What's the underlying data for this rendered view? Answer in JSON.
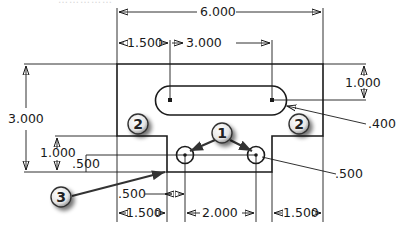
{
  "drawing": {
    "title_faint": "……………",
    "overall": {
      "width_label": "6.000",
      "height_label": "3.000"
    },
    "slot": {
      "offset_label": "1.500",
      "length_label": "3.000",
      "height_label": "1.000",
      "radius_label": ".400"
    },
    "notch": {
      "depth_label": "1.000",
      "left_width_label": "1.500",
      "right_width_label": "1.500",
      "hole_spacing_label": "2.000",
      "hole_height_label": ".500",
      "hole_offset_label": ".500",
      "hole_dia_label": ".500"
    },
    "balloons": [
      {
        "id": "1",
        "label": "1"
      },
      {
        "id": "2a",
        "label": "2"
      },
      {
        "id": "2b",
        "label": "2"
      },
      {
        "id": "3",
        "label": "3"
      }
    ],
    "colors": {
      "line": "#1a1a1a",
      "balloon_fill": "#f2f2f2",
      "balloon_shadow": "#888888"
    }
  }
}
